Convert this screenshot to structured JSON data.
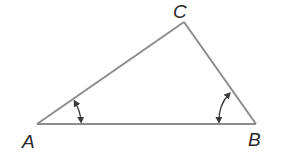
{
  "diagram": {
    "type": "triangle",
    "stroke_color": "#8c8c8c",
    "marker_color": "#3a3a3a",
    "vertices": [
      {
        "name": "A",
        "label": "A",
        "x": 37,
        "y": 124
      },
      {
        "name": "B",
        "label": "B",
        "x": 256,
        "y": 124
      },
      {
        "name": "C",
        "label": "C",
        "x": 184,
        "y": 22
      }
    ],
    "sides": [
      "AB",
      "BC",
      "CA"
    ],
    "angle_markers": [
      {
        "vertex": "A",
        "style": "double-arrow arc"
      },
      {
        "vertex": "B",
        "style": "double-arrow arc"
      }
    ]
  }
}
